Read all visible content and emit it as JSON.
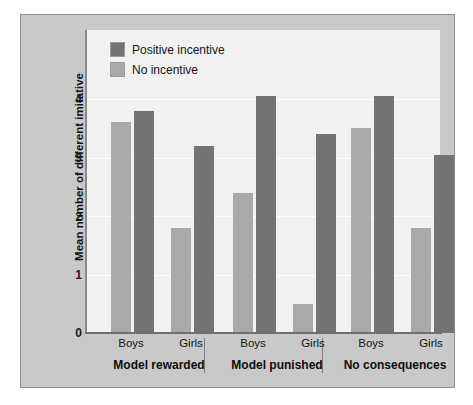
{
  "chart_data": {
    "type": "bar",
    "title": "",
    "xlabel": "",
    "ylabel": "Mean number of different imitative responses reproduced",
    "ylim": [
      0,
      4.7
    ],
    "yticks": [
      0,
      1,
      2,
      3,
      4
    ],
    "ytick_labels": [
      "0",
      "1",
      "2",
      "3",
      "4"
    ],
    "grid": true,
    "legend_position": "top-left",
    "categories": [
      "Model rewarded / Boys",
      "Model rewarded / Girls",
      "Model punished / Boys",
      "Model punished / Girls",
      "No consequences / Boys",
      "No consequences / Girls"
    ],
    "series": [
      {
        "name": "No incentive",
        "color": "#a9a9a9",
        "values": [
          3.6,
          1.8,
          2.4,
          0.5,
          3.5,
          1.8
        ]
      },
      {
        "name": "Positive incentive",
        "color": "#737373",
        "values": [
          3.8,
          3.2,
          4.05,
          3.4,
          4.05,
          3.05
        ]
      }
    ],
    "groups": [
      {
        "label": "Model rewarded",
        "subgroups": [
          {
            "label": "Boys",
            "no_incentive": 3.6,
            "positive_incentive": 3.8
          },
          {
            "label": "Girls",
            "no_incentive": 1.8,
            "positive_incentive": 3.2
          }
        ]
      },
      {
        "label": "Model punished",
        "subgroups": [
          {
            "label": "Boys",
            "no_incentive": 2.4,
            "positive_incentive": 4.05
          },
          {
            "label": "Girls",
            "no_incentive": 0.5,
            "positive_incentive": 3.4
          }
        ]
      },
      {
        "label": "No consequences",
        "subgroups": [
          {
            "label": "Boys",
            "no_incentive": 3.5,
            "positive_incentive": 4.05
          },
          {
            "label": "Girls",
            "no_incentive": 1.8,
            "positive_incentive": 3.05
          }
        ]
      }
    ]
  },
  "legend": {
    "items": [
      {
        "label": "Positive incentive",
        "color": "#737373",
        "key": "positive_incentive"
      },
      {
        "label": "No incentive",
        "color": "#a9a9a9",
        "key": "no_incentive"
      }
    ]
  },
  "axis": {
    "y_title": "Mean number of different imitative responses reproduced",
    "y_tick_labels": [
      "4",
      "3",
      "2",
      "1",
      "0"
    ]
  },
  "x_axis": {
    "subgroup_labels": [
      "Boys",
      "Girls",
      "Boys",
      "Girls",
      "Boys",
      "Girls"
    ],
    "group_labels": [
      "Model rewarded",
      "Model punished",
      "No consequences"
    ]
  },
  "colors": {
    "frame": "#c9c9c9",
    "plot_background": "#f1f1f1",
    "gridline": "#ffffff",
    "axis": "#6f6f6f",
    "bar_light": "#a9a9a9",
    "bar_dark": "#737373",
    "text": "#141414"
  }
}
